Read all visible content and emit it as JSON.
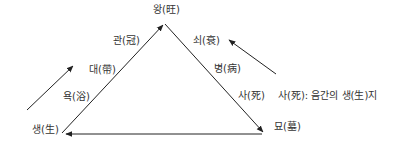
{
  "diagram": {
    "stages": {
      "saeng": "생(生)",
      "yok": "욕(浴)",
      "dae": "대(帶)",
      "gwan": "관(冠)",
      "wang": "왕(旺)",
      "soe": "쇠(衰)",
      "byeong": "병(病)",
      "sa": "사(死)",
      "myo": "묘(墓)"
    },
    "annotation": "사(死): 음간의 생(生)지",
    "line_color": "#222222",
    "text_color": "#333333"
  }
}
